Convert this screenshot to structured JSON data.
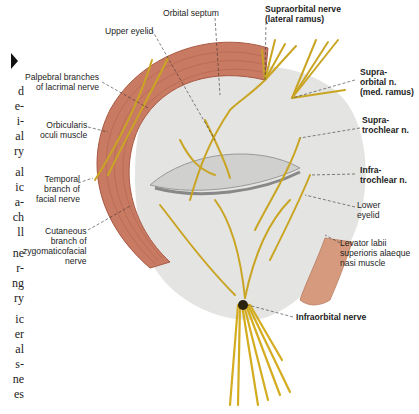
{
  "figure": {
    "labels": {
      "orbital_septum": "Orbital septum",
      "upper_eyelid": "Upper eyelid",
      "palpebral_branches": "Palpebral branches\nof lacrimal nerve",
      "orbicularis": "Orbicularis\noculi muscle",
      "temporal_branch": "Temporal\nbranch of\nfacial nerve",
      "cutaneous_branch": "Cutaneous\nbranch of\nzygomaticofacial\nnerve",
      "supraorbital_lateral": "Supraorbital nerve\n(lateral ramus)",
      "supraorbital_medial": "Supra-\norbital n.\n(med. ramus)",
      "supratrochlear": "Supra-\ntrochlear n.",
      "infratrochlear": "Infra-\ntrochlear n.",
      "lower_eyelid": "Lower\neyelid",
      "levator_labii": "Levator labii\nsuperioris alaeque\nnasi muscle",
      "infraorbital": "Infraorbital nerve"
    }
  },
  "page_fragments": [
    "d",
    "e-",
    "i-",
    "al",
    "ry",
    "",
    "al",
    "ic",
    "a-",
    "ch",
    "ll",
    "",
    "ne",
    "r-",
    "ng",
    "ry",
    "",
    "ic",
    "er",
    "al",
    "s-",
    "ne",
    "es"
  ],
  "colors": {
    "muscle": "#c97a62",
    "muscle_dark": "#a95a45",
    "nerve": "#c9a523",
    "skin": "#e6e6e4",
    "eyelid": "#d2d2d0"
  }
}
